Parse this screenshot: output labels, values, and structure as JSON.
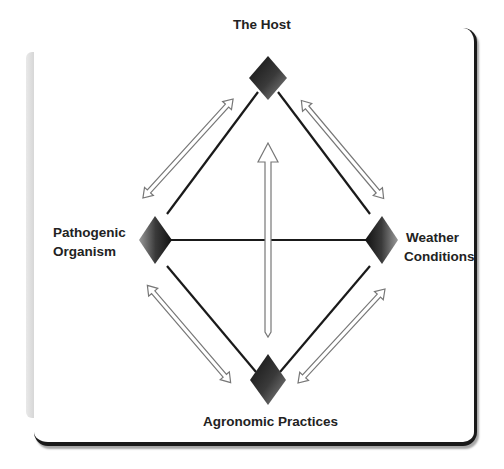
{
  "diagram": {
    "type": "disease-pyramid",
    "nodes": {
      "top": {
        "label": "The Host"
      },
      "left": {
        "label_line1": "Pathogenic",
        "label_line2": "Organism"
      },
      "right": {
        "label_line1": "Weather",
        "label_line2": "Conditions"
      },
      "bottom": {
        "label": "Agronomic Practices"
      }
    },
    "edges": [
      {
        "from": "The Host",
        "to": "Pathogenic Organism",
        "arrow": "double-headed"
      },
      {
        "from": "The Host",
        "to": "Weather Conditions",
        "arrow": "double-headed"
      },
      {
        "from": "Pathogenic Organism",
        "to": "Agronomic Practices",
        "arrow": "double-headed"
      },
      {
        "from": "Weather Conditions",
        "to": "Agronomic Practices",
        "arrow": "double-headed"
      },
      {
        "from": "Agronomic Practices",
        "to": "The Host",
        "arrow": "single-headed-up"
      },
      {
        "from": "Pathogenic Organism",
        "to": "Weather Conditions",
        "arrow": "none"
      }
    ],
    "colors": {
      "line": "#1a1a1a",
      "marker_dark": "#1a1a1a",
      "marker_mid": "#555555",
      "arrow_outline": "#777777",
      "frame_shadow": "#1a1a1a"
    }
  }
}
